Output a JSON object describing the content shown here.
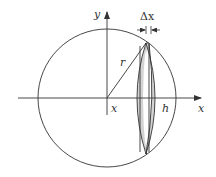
{
  "diagram": {
    "labels": {
      "y_axis": "y",
      "x_axis": "x",
      "delta_x": "Δx",
      "radius": "r",
      "x_position": "x",
      "cap_height": "h"
    },
    "colors": {
      "line": "#333333",
      "slice_fill": "#d3d3d3",
      "background": "#ffffff"
    }
  }
}
